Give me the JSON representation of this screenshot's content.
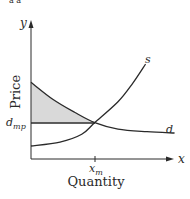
{
  "header_fragment": "a a",
  "chart_data": {
    "type": "line",
    "title": "",
    "xlabel": "Quantity",
    "ylabel": "Price",
    "x_axis_symbol": "x",
    "y_axis_symbol": "y",
    "xlim": [
      0,
      10
    ],
    "ylim": [
      0,
      10
    ],
    "series": [
      {
        "name": "d",
        "label": "d",
        "description": "downward-sloping demand curve, convex, flattening to the right",
        "points": [
          [
            0,
            5.9
          ],
          [
            1.5,
            4.6
          ],
          [
            3,
            3.6
          ],
          [
            4.4,
            2.8
          ],
          [
            6,
            2.3
          ],
          [
            8,
            2.1
          ],
          [
            9.9,
            2.0
          ]
        ]
      },
      {
        "name": "s",
        "label": "s",
        "description": "upward-sloping supply curve, convex",
        "points": [
          [
            0,
            1.0
          ],
          [
            2,
            1.3
          ],
          [
            3.5,
            1.9
          ],
          [
            4.4,
            2.8
          ],
          [
            6,
            4.4
          ],
          [
            7,
            5.8
          ],
          [
            7.9,
            7.3
          ]
        ]
      },
      {
        "name": "d_mp",
        "label": "d_mp",
        "description": "horizontal line at equilibrium price",
        "points": [
          [
            0,
            2.8
          ],
          [
            4.4,
            2.8
          ]
        ]
      }
    ],
    "annotations": [
      {
        "text": "d",
        "sub": "mp",
        "role": "y-tick label at equilibrium price"
      },
      {
        "text": "x",
        "sub": "m",
        "role": "x-tick label at equilibrium quantity"
      },
      {
        "text": "shaded region",
        "role": "consumer surplus: area between demand curve and d_mp line"
      }
    ],
    "shaded_fill": "#d9d9d9",
    "line_color": "#2a2a2a",
    "grid": false
  }
}
